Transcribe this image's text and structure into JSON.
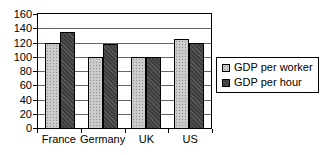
{
  "chart_data": {
    "type": "bar",
    "title": "",
    "xlabel": "",
    "ylabel": "",
    "categories": [
      "France",
      "Germany",
      "UK",
      "US"
    ],
    "series": [
      {
        "name": "GDP per worker",
        "values": [
          120,
          100,
          100,
          125
        ],
        "color": "#cbcbcb",
        "pattern": "stipple-dots"
      },
      {
        "name": "GDP per hour",
        "values": [
          135,
          118,
          100,
          120
        ],
        "color": "#3e3e3e",
        "pattern": "diagonal-hatch"
      }
    ],
    "ylim": [
      0,
      160
    ],
    "yticks": [
      0,
      20,
      40,
      60,
      80,
      100,
      120,
      140,
      160
    ],
    "grid": true,
    "legend_position": "right",
    "colors": {
      "bar_border": "#000000",
      "gridline": "#666666",
      "axis": "#000000",
      "background": "#ffffff",
      "text": "#000000"
    }
  }
}
